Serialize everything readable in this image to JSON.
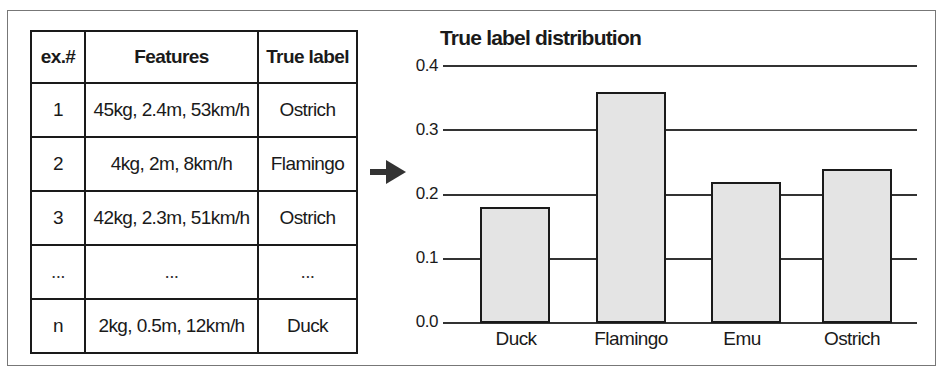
{
  "table": {
    "headers": [
      "ex.#",
      "Features",
      "True label"
    ],
    "rows": [
      [
        "1",
        "45kg, 2.4m, 53km/h",
        "Ostrich"
      ],
      [
        "2",
        "4kg, 2m, 8km/h",
        "Flamingo"
      ],
      [
        "3",
        "42kg, 2.3m, 51km/h",
        "Ostrich"
      ],
      [
        "...",
        "...",
        "..."
      ],
      [
        "n",
        "2kg, 0.5m, 12km/h",
        "Duck"
      ]
    ]
  },
  "arrow": {
    "icon": "arrow-right-icon",
    "color": "#333333"
  },
  "chart_data": {
    "type": "bar",
    "title": "True label distribution",
    "categories": [
      "Duck",
      "Flamingo",
      "Emu",
      "Ostrich"
    ],
    "values": [
      0.18,
      0.36,
      0.22,
      0.24
    ],
    "xlabel": "",
    "ylabel": "",
    "ylim": [
      0.0,
      0.4
    ],
    "yticks": [
      "0.0",
      "0.1",
      "0.2",
      "0.3",
      "0.4"
    ],
    "grid": true,
    "bar_color": "#e4e4e4",
    "bar_edge_color": "#1a1a1a",
    "note": "Values estimated from pixel positions; approx. ±0.01"
  }
}
